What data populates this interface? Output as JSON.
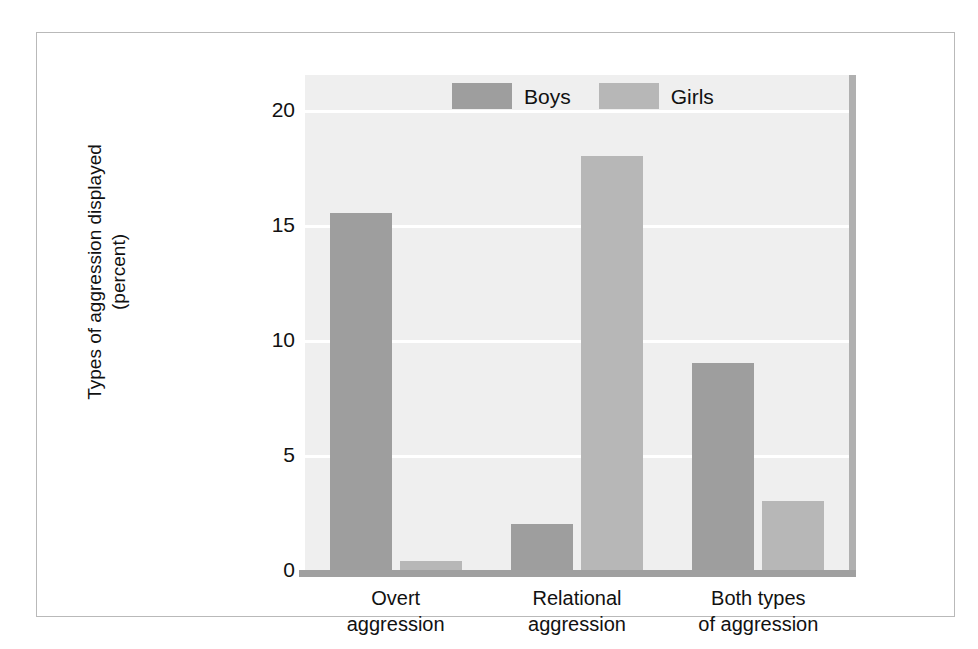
{
  "chart_data": {
    "type": "bar",
    "title": "",
    "xlabel": "",
    "ylabel": "Types of aggression displayed (percent)",
    "ylabel_lines": [
      "Types of aggression displayed",
      "(percent)"
    ],
    "categories": [
      "Overt aggression",
      "Relational aggression",
      "Both types of aggression"
    ],
    "category_lines": [
      [
        "Overt",
        "aggression"
      ],
      [
        "Relational",
        "aggression"
      ],
      [
        "Both types",
        "of aggression"
      ]
    ],
    "series": [
      {
        "name": "Boys",
        "color": "#9e9e9e",
        "values": [
          15.5,
          2.0,
          9.0
        ]
      },
      {
        "name": "Girls",
        "color": "#b7b7b7",
        "values": [
          0.4,
          18.0,
          3.0
        ]
      }
    ],
    "ylim": [
      0,
      21.5
    ],
    "yticks": [
      0,
      5,
      10,
      15,
      20
    ],
    "ytick_labels": [
      "0",
      "5",
      "10",
      "15",
      "20"
    ],
    "grid": true,
    "grid_color": "#ffffff",
    "legend_position": "top-center",
    "plot_background": "#efefef"
  }
}
